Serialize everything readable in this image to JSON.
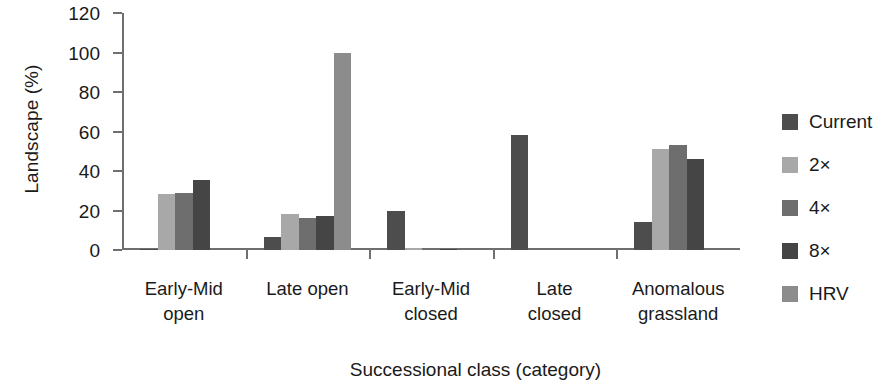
{
  "chart_data": {
    "type": "bar",
    "title": "",
    "xlabel": "Successional class (category)",
    "ylabel": "Landscape (%)",
    "ylim": [
      0,
      120
    ],
    "yticks": [
      0,
      20,
      40,
      60,
      80,
      100,
      120
    ],
    "grid": false,
    "legend_position": "right",
    "categories": [
      "Early-Mid open",
      "Late open",
      "Early-Mid closed",
      "Late closed",
      "Anomalous grassland"
    ],
    "category_lines": [
      [
        "Early-Mid",
        "open"
      ],
      [
        "Late open",
        ""
      ],
      [
        "Early-Mid",
        "closed"
      ],
      [
        "Late",
        "closed"
      ],
      [
        "Anomalous",
        "grassland"
      ]
    ],
    "series": [
      {
        "name": "Current",
        "color": "#4d4d4d",
        "values": [
          0.5,
          6.5,
          20,
          58,
          14
        ]
      },
      {
        "name": "2×",
        "color": "#a8a8a8",
        "values": [
          28.5,
          18,
          1.2,
          0,
          51
        ]
      },
      {
        "name": "4×",
        "color": "#6e6e6e",
        "values": [
          29,
          16,
          0.5,
          0,
          53
        ]
      },
      {
        "name": "8×",
        "color": "#454545",
        "values": [
          35.5,
          17,
          0.3,
          0,
          46
        ]
      },
      {
        "name": "HRV",
        "color": "#8c8c8c",
        "values": [
          0,
          100,
          0,
          0,
          0
        ]
      }
    ]
  },
  "legend": {
    "items": [
      {
        "label": "Current",
        "color": "#4d4d4d"
      },
      {
        "label": "2×",
        "color": "#a8a8a8"
      },
      {
        "label": "4×",
        "color": "#6e6e6e"
      },
      {
        "label": "8×",
        "color": "#454545"
      },
      {
        "label": "HRV",
        "color": "#8c8c8c"
      }
    ]
  },
  "axis": {
    "y_tick_labels": [
      "120",
      "100",
      "80",
      "60",
      "40",
      "20",
      "0"
    ],
    "y_title": "Landscape (%)",
    "x_title": "Successional class (category)"
  }
}
